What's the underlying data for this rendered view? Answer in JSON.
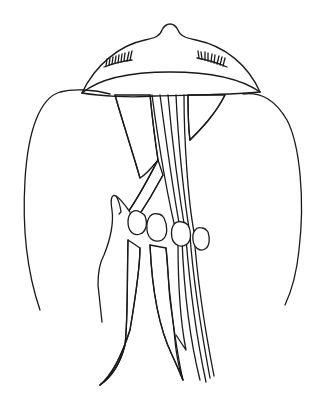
{
  "illustration": {
    "subject": "back of head with hair divided into three patterned strands being braided by a hand",
    "caption_partial": "",
    "colors": {
      "ink": "#1a1a1a",
      "background": "#ffffff"
    },
    "strands": [
      {
        "name": "dotted-strand",
        "pattern": "dots"
      },
      {
        "name": "chevron-strand",
        "pattern": "chevrons"
      },
      {
        "name": "lined-strand",
        "pattern": "stripes"
      }
    ]
  }
}
